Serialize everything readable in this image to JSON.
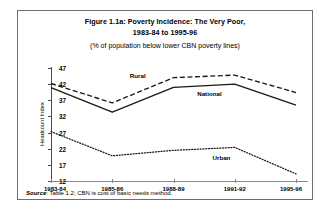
{
  "figure": {
    "title_line1": "Figure 1.1a: Poverty Incidence: The Very Poor,",
    "title_line2": "1983-84 to 1995-96",
    "subtitle": "(% of population below lower CBN poverty lines)",
    "source_prefix": "Source",
    "source_text": ": Table 1.2; CBN is cost of basic needs method."
  },
  "chart_data": {
    "type": "line",
    "title": "Figure 1.1a: Poverty Incidence: The Very Poor, 1983-84 to 1995-96",
    "subtitle": "(% of population below lower CBN poverty lines)",
    "xlabel": "",
    "ylabel": "Headcount Index",
    "categories": [
      "1983-84",
      "1985-86",
      "1988-89",
      "1991-92",
      "1995-96"
    ],
    "ylim": [
      12,
      47
    ],
    "yticks": [
      47,
      42,
      37,
      32,
      27,
      22,
      17,
      12
    ],
    "grid": false,
    "legend_position": "inline-annotations",
    "series": [
      {
        "name": "Rural",
        "style": "dashed",
        "color": "#1a1a1a",
        "values": [
          42.2,
          36.2,
          44.0,
          44.8,
          39.4
        ],
        "label_x": 1.45,
        "label_y": 44.6
      },
      {
        "name": "National",
        "style": "solid",
        "color": "#1a1a1a",
        "values": [
          40.9,
          33.3,
          41.0,
          42.0,
          35.5
        ],
        "label_x": 2.55,
        "label_y": 39.0
      },
      {
        "name": "Urban",
        "style": "dotted",
        "color": "#1a1a1a",
        "values": [
          27.3,
          19.8,
          21.5,
          22.4,
          14.2
        ],
        "label_x": 2.8,
        "label_y": 19.0
      }
    ]
  }
}
